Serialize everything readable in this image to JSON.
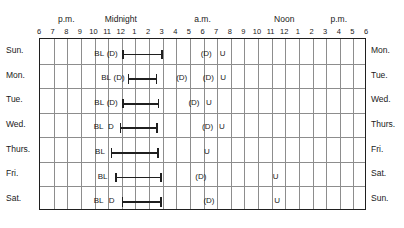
{
  "chart_data": {
    "type": "table",
    "xlabel": "Time of day",
    "ylabel": "Day of week",
    "grid": true,
    "axis_start_hour_label": "6 p.m.",
    "axis_end_hour_label": "6 p.m.",
    "hours_span": 24,
    "period_labels": [
      {
        "text": "p.m.",
        "hour": 2
      },
      {
        "text": "Midnight",
        "hour": 6
      },
      {
        "text": "a.m.",
        "hour": 12
      },
      {
        "text": "Noon",
        "hour": 18
      },
      {
        "text": "p.m.",
        "hour": 22
      }
    ],
    "hour_ticks": [
      {
        "label": "6",
        "hour": 0
      },
      {
        "label": "7",
        "hour": 1
      },
      {
        "label": "8",
        "hour": 2
      },
      {
        "label": "9",
        "hour": 3
      },
      {
        "label": "10",
        "hour": 4
      },
      {
        "label": "11",
        "hour": 5
      },
      {
        "label": "12",
        "hour": 6
      },
      {
        "label": "1",
        "hour": 7
      },
      {
        "label": "2",
        "hour": 8
      },
      {
        "label": "3",
        "hour": 9
      },
      {
        "label": "4",
        "hour": 10
      },
      {
        "label": "5",
        "hour": 11
      },
      {
        "label": "6",
        "hour": 12
      },
      {
        "label": "7",
        "hour": 13
      },
      {
        "label": "8",
        "hour": 14
      },
      {
        "label": "9",
        "hour": 15
      },
      {
        "label": "10",
        "hour": 16
      },
      {
        "label": "11",
        "hour": 17
      },
      {
        "label": "12",
        "hour": 18
      },
      {
        "label": "1",
        "hour": 19
      },
      {
        "label": "2",
        "hour": 20
      },
      {
        "label": "3",
        "hour": 21
      },
      {
        "label": "4",
        "hour": 22
      },
      {
        "label": "5",
        "hour": 23
      },
      {
        "label": "6",
        "hour": 24
      }
    ],
    "rows": [
      {
        "day_start": "Sun.",
        "day_end": "Mon.",
        "marks": [
          {
            "text": "BL",
            "hour": 4.35
          },
          {
            "text": "(D)",
            "hour": 5.3
          },
          {
            "text": "(D)",
            "hour": 12.2
          },
          {
            "text": "U",
            "hour": 13.4
          }
        ],
        "sleep": {
          "start_hour": 6.05,
          "end_hour": 9.0
        }
      },
      {
        "day_start": "Mon.",
        "day_end": "Tue.",
        "marks": [
          {
            "text": "BL",
            "hour": 4.85
          },
          {
            "text": "(D)",
            "hour": 5.8
          },
          {
            "text": "(D)",
            "hour": 10.4
          },
          {
            "text": "(D)",
            "hour": 12.35
          },
          {
            "text": "U",
            "hour": 13.45
          }
        ],
        "sleep": {
          "start_hour": 6.45,
          "end_hour": 8.6
        }
      },
      {
        "day_start": "Tue.",
        "day_end": "Wed.",
        "marks": [
          {
            "text": "BL",
            "hour": 4.35
          },
          {
            "text": "(D)",
            "hour": 5.3
          },
          {
            "text": "(D)",
            "hour": 11.3
          },
          {
            "text": "U",
            "hour": 12.4
          }
        ],
        "sleep": {
          "start_hour": 6.05,
          "end_hour": 8.75
        }
      },
      {
        "day_start": "Wed.",
        "day_end": "Thurs.",
        "marks": [
          {
            "text": "BL",
            "hour": 4.3
          },
          {
            "text": "D",
            "hour": 5.2
          },
          {
            "text": "(D)",
            "hour": 12.3
          },
          {
            "text": "U",
            "hour": 13.35
          }
        ],
        "sleep": {
          "start_hour": 5.85,
          "end_hour": 8.65
        }
      },
      {
        "day_start": "Thurs.",
        "day_end": "Fri.",
        "marks": [
          {
            "text": "BL",
            "hour": 4.4
          },
          {
            "text": "U",
            "hour": 12.25
          }
        ],
        "sleep": {
          "start_hour": 5.2,
          "end_hour": 8.7
        }
      },
      {
        "day_start": "Fri.",
        "day_end": "Sat.",
        "marks": [
          {
            "text": "BL",
            "hour": 4.6
          },
          {
            "text": "(D)",
            "hour": 11.8
          },
          {
            "text": "U",
            "hour": 17.3
          }
        ],
        "sleep": {
          "start_hour": 5.5,
          "end_hour": 8.95
        }
      },
      {
        "day_start": "Sat.",
        "day_end": "Sun.",
        "marks": [
          {
            "text": "BL",
            "hour": 4.3
          },
          {
            "text": "D",
            "hour": 5.25
          },
          {
            "text": "(D)",
            "hour": 12.4
          },
          {
            "text": "U",
            "hour": 17.4
          }
        ],
        "sleep": {
          "start_hour": 6.0,
          "end_hour": 8.95
        }
      }
    ],
    "legend": [
      {
        "code": "BL",
        "meaning": "BL"
      },
      {
        "code": "D",
        "meaning": "D"
      },
      {
        "code": "(D)",
        "meaning": "(D)"
      },
      {
        "code": "U",
        "meaning": "U"
      }
    ]
  }
}
